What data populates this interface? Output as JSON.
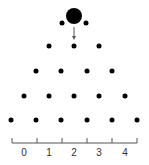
{
  "diagram": {
    "type": "galton-board",
    "ball": {
      "x": 74,
      "y": 16,
      "r": 8,
      "color": "#000000"
    },
    "arrow": {
      "x": 74,
      "y1": 27,
      "y2": 40
    },
    "pegs": [
      {
        "row": 1,
        "y": 23,
        "xs": [
          62,
          86
        ]
      },
      {
        "row": 2,
        "y": 46,
        "xs": [
          49,
          74,
          99
        ]
      },
      {
        "row": 3,
        "y": 71,
        "xs": [
          36,
          61,
          87,
          112
        ]
      },
      {
        "row": 4,
        "y": 96,
        "xs": [
          24,
          49,
          74,
          99,
          125
        ]
      },
      {
        "row": 5,
        "y": 120,
        "xs": [
          11,
          36,
          61,
          87,
          112,
          137
        ]
      }
    ],
    "peg_radius": 2.5,
    "axis": {
      "y": 143,
      "x_start": 12,
      "x_end": 137,
      "ticks": [
        12,
        37,
        62,
        87,
        112,
        137
      ],
      "labels": [
        "0",
        "1",
        "2",
        "3",
        "4"
      ],
      "label_xs": [
        24,
        49,
        74,
        99,
        125
      ],
      "label_y": 147
    },
    "colors": {
      "ink": "#000000",
      "axis": "#555555"
    }
  }
}
